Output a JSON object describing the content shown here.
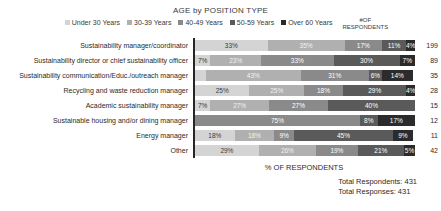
{
  "header": {
    "title": "AGE by POSITION TYPE",
    "respondents_header_line1": "#OF",
    "respondents_header_line2": "RESPONDENTS"
  },
  "legend": {
    "items": [
      {
        "label": "Under 30 Years",
        "color": "#d4d4d4"
      },
      {
        "label": "30-39 Years",
        "color": "#b0b0b0"
      },
      {
        "label": "40-49 Years",
        "color": "#8a8a8a"
      },
      {
        "label": "50-59 Years",
        "color": "#5a5a5a"
      },
      {
        "label": "Over 60 Years",
        "color": "#2b2b2b"
      }
    ]
  },
  "footer": {
    "axis_title": "% OF RESPONDENTS",
    "total_respondents": "Total Respondents: 431",
    "total_responses": "Total Responses: 431"
  },
  "chart_data": {
    "type": "bar",
    "orientation": "horizontal",
    "stacked": true,
    "title": "AGE by POSITION TYPE",
    "xlabel": "% OF RESPONDENTS",
    "ylabel": "",
    "xlim": [
      0,
      100
    ],
    "grid": false,
    "legend_position": "top",
    "series": [
      {
        "name": "Under 30 Years",
        "color": "#d4d4d4",
        "values": [
          33,
          7,
          5,
          25,
          7,
          0,
          18,
          29
        ]
      },
      {
        "name": "30-39 Years",
        "color": "#b0b0b0",
        "values": [
          35,
          23,
          43,
          25,
          27,
          0,
          18,
          26
        ]
      },
      {
        "name": "40-49 Years",
        "color": "#8a8a8a",
        "values": [
          17,
          33,
          31,
          18,
          27,
          75,
          9,
          19
        ]
      },
      {
        "name": "50-59 Years",
        "color": "#5a5a5a",
        "values": [
          11,
          30,
          6,
          29,
          40,
          8,
          45,
          21
        ]
      },
      {
        "name": "Over 60 Years",
        "color": "#2b2b2b",
        "values": [
          4,
          7,
          14,
          4,
          0,
          17,
          9,
          5
        ]
      }
    ],
    "categories": [
      "Sustainability manager/coordinator",
      "Sustainability director or chief sustainability officer",
      "Sustainability communication/Educ./outreach manager",
      "Recycling and waste reduction manager",
      "Academic sustainability manager",
      "Sustainable housing and/or dining manager",
      "Energy manager",
      "Other"
    ],
    "respondents": [
      199,
      89,
      35,
      28,
      15,
      12,
      11,
      42
    ],
    "rows": [
      {
        "category": "Sustainability manager/coordinator",
        "respondents": "199",
        "segments": [
          {
            "label": "33%",
            "value": 33,
            "color": "#d4d4d4",
            "text": "#3a3a3a"
          },
          {
            "label": "35%",
            "value": 35,
            "color": "#b0b0b0",
            "text": "#f2f2f2"
          },
          {
            "label": "17%",
            "value": 17,
            "color": "#8a8a8a",
            "text": "#ffffff"
          },
          {
            "label": "11%",
            "value": 11,
            "color": "#5a5a5a",
            "text": "#ffffff"
          },
          {
            "label": "4%",
            "value": 4,
            "color": "#2b2b2b",
            "text": "#ffffff"
          }
        ]
      },
      {
        "category": "Sustainability director or chief sustainability officer",
        "respondents": "89",
        "segments": [
          {
            "label": "7%",
            "value": 7,
            "color": "#d4d4d4",
            "text": "#3a3a3a"
          },
          {
            "label": "23%",
            "value": 23,
            "color": "#b0b0b0",
            "text": "#f2f2f2"
          },
          {
            "label": "33%",
            "value": 33,
            "color": "#8a8a8a",
            "text": "#ffffff"
          },
          {
            "label": "30%",
            "value": 30,
            "color": "#5a5a5a",
            "text": "#ffffff"
          },
          {
            "label": "7%",
            "value": 7,
            "color": "#2b2b2b",
            "text": "#ffffff"
          }
        ]
      },
      {
        "category": "Sustainability communication/Educ./outreach manager",
        "respondents": "35",
        "segments": [
          {
            "label": "",
            "value": 5,
            "color": "#d4d4d4",
            "text": "#3a3a3a"
          },
          {
            "label": "43%",
            "value": 43,
            "color": "#b0b0b0",
            "text": "#f2f2f2"
          },
          {
            "label": "31%",
            "value": 31,
            "color": "#8a8a8a",
            "text": "#ffffff"
          },
          {
            "label": "6%",
            "value": 6,
            "color": "#5a5a5a",
            "text": "#ffffff"
          },
          {
            "label": "14%",
            "value": 14,
            "color": "#2b2b2b",
            "text": "#ffffff"
          }
        ]
      },
      {
        "category": "Recycling and waste reduction manager",
        "respondents": "28",
        "segments": [
          {
            "label": "25%",
            "value": 25,
            "color": "#d4d4d4",
            "text": "#3a3a3a"
          },
          {
            "label": "25%",
            "value": 25,
            "color": "#b0b0b0",
            "text": "#f2f2f2"
          },
          {
            "label": "18%",
            "value": 18,
            "color": "#8a8a8a",
            "text": "#ffffff"
          },
          {
            "label": "29%",
            "value": 29,
            "color": "#5a5a5a",
            "text": "#ffffff"
          },
          {
            "label": "4%",
            "value": 4,
            "color": "#2b2b2b",
            "text": "#ffffff"
          }
        ]
      },
      {
        "category": "Academic sustainability manager",
        "respondents": "15",
        "segments": [
          {
            "label": "7%",
            "value": 7,
            "color": "#d4d4d4",
            "text": "#3a3a3a"
          },
          {
            "label": "27%",
            "value": 27,
            "color": "#b0b0b0",
            "text": "#f2f2f2"
          },
          {
            "label": "27%",
            "value": 27,
            "color": "#8a8a8a",
            "text": "#ffffff"
          },
          {
            "label": "40%",
            "value": 40,
            "color": "#5a5a5a",
            "text": "#ffffff"
          }
        ]
      },
      {
        "category": "Sustainable housing and/or dining manager",
        "respondents": "12",
        "segments": [
          {
            "label": "75%",
            "value": 75,
            "color": "#8a8a8a",
            "text": "#ffffff"
          },
          {
            "label": "8%",
            "value": 8,
            "color": "#5a5a5a",
            "text": "#ffffff"
          },
          {
            "label": "17%",
            "value": 17,
            "color": "#2b2b2b",
            "text": "#ffffff"
          }
        ]
      },
      {
        "category": "Energy manager",
        "respondents": "11",
        "segments": [
          {
            "label": "18%",
            "value": 18,
            "color": "#d4d4d4",
            "text": "#3a3a3a"
          },
          {
            "label": "18%",
            "value": 18,
            "color": "#b0b0b0",
            "text": "#f2f2f2"
          },
          {
            "label": "9%",
            "value": 9,
            "color": "#8a8a8a",
            "text": "#ffffff"
          },
          {
            "label": "45%",
            "value": 45,
            "color": "#5a5a5a",
            "text": "#ffffff"
          },
          {
            "label": "9%",
            "value": 9,
            "color": "#2b2b2b",
            "text": "#ffffff"
          }
        ]
      },
      {
        "category": "Other",
        "respondents": "42",
        "segments": [
          {
            "label": "29%",
            "value": 29,
            "color": "#d4d4d4",
            "text": "#3a3a3a"
          },
          {
            "label": "26%",
            "value": 26,
            "color": "#b0b0b0",
            "text": "#f2f2f2"
          },
          {
            "label": "19%",
            "value": 19,
            "color": "#8a8a8a",
            "text": "#ffffff"
          },
          {
            "label": "21%",
            "value": 21,
            "color": "#5a5a5a",
            "text": "#ffffff"
          },
          {
            "label": "5%",
            "value": 5,
            "color": "#2b2b2b",
            "text": "#ffffff"
          }
        ]
      }
    ]
  }
}
